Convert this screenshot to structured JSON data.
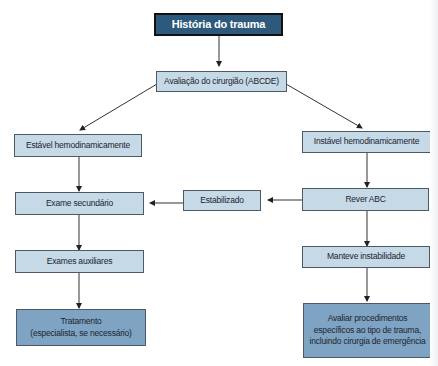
{
  "diagram": {
    "type": "flowchart",
    "colors": {
      "title_box": "#2d5a7c",
      "step_box": "#c5d9e7",
      "final_box": "#7fa3c2",
      "connector": "#333333"
    },
    "nodes": {
      "historia": "História do trauma",
      "avaliacao": "Avaliação do cirurgião (ABCDE)",
      "estavel": "Estável hemodinamicamente",
      "instavel": "Instável hemodinamicamente",
      "exame_secundario": "Exame secundário",
      "estabilizado": "Estabilizado",
      "rever_abc": "Rever ABC",
      "exames_auxiliares": "Exames auxiliares",
      "manteve": "Manteve instabilidade",
      "tratamento_line1": "Tratamento",
      "tratamento_line2": "(especialista, se necessário)",
      "avaliar_line1": "Avaliar procedimentos",
      "avaliar_line2": "específicos ao tipo de trauma,",
      "avaliar_line3": "incluindo cirurgia de emergência"
    },
    "edges": [
      [
        "historia",
        "avaliacao"
      ],
      [
        "avaliacao",
        "estavel"
      ],
      [
        "avaliacao",
        "instavel"
      ],
      [
        "estavel",
        "exame_secundario"
      ],
      [
        "instavel",
        "rever_abc"
      ],
      [
        "rever_abc",
        "estabilizado"
      ],
      [
        "estabilizado",
        "exame_secundario"
      ],
      [
        "exame_secundario",
        "exames_auxiliares"
      ],
      [
        "rever_abc",
        "manteve"
      ],
      [
        "exames_auxiliares",
        "tratamento"
      ],
      [
        "manteve",
        "avaliar"
      ]
    ]
  }
}
